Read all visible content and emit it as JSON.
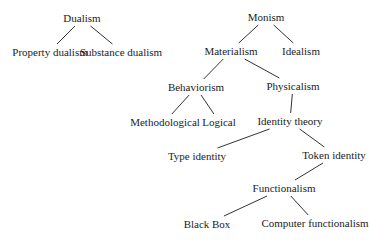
{
  "diagram": {
    "type": "tree",
    "nodes": [
      {
        "id": "dualism",
        "label": "Dualism"
      },
      {
        "id": "property-dualism",
        "label": "Property dualism"
      },
      {
        "id": "substance-dualism",
        "label": "Substance dualism"
      },
      {
        "id": "monism",
        "label": "Monism"
      },
      {
        "id": "materialism",
        "label": "Materialism"
      },
      {
        "id": "idealism",
        "label": "Idealism"
      },
      {
        "id": "behaviorism",
        "label": "Behaviorism"
      },
      {
        "id": "physicalism",
        "label": "Physicalism"
      },
      {
        "id": "methodological",
        "label": "Methodological"
      },
      {
        "id": "logical",
        "label": "Logical"
      },
      {
        "id": "identity-theory",
        "label": "Identity theory"
      },
      {
        "id": "type-identity",
        "label": "Type identity"
      },
      {
        "id": "token-identity",
        "label": "Token identity"
      },
      {
        "id": "functionalism",
        "label": "Functionalism"
      },
      {
        "id": "black-box",
        "label": "Black Box"
      },
      {
        "id": "computer-functionalism",
        "label": "Computer functionalism"
      }
    ],
    "edges": [
      [
        "dualism",
        "property-dualism"
      ],
      [
        "dualism",
        "substance-dualism"
      ],
      [
        "monism",
        "materialism"
      ],
      [
        "monism",
        "idealism"
      ],
      [
        "materialism",
        "behaviorism"
      ],
      [
        "materialism",
        "physicalism"
      ],
      [
        "behaviorism",
        "methodological"
      ],
      [
        "behaviorism",
        "logical"
      ],
      [
        "physicalism",
        "identity-theory"
      ],
      [
        "identity-theory",
        "type-identity"
      ],
      [
        "identity-theory",
        "token-identity"
      ],
      [
        "token-identity",
        "functionalism"
      ],
      [
        "functionalism",
        "black-box"
      ],
      [
        "functionalism",
        "computer-functionalism"
      ]
    ]
  }
}
